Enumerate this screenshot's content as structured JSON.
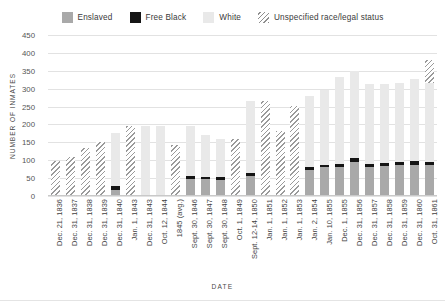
{
  "legend": {
    "items": [
      {
        "label": "Enslaved",
        "swatch": "enslaved-swatch",
        "color": "#a9a9a9"
      },
      {
        "label": "Free Black",
        "swatch": "free-black-swatch",
        "color": "#151515"
      },
      {
        "label": "White",
        "swatch": "white-swatch",
        "color": "#e9e9e9"
      },
      {
        "label": "Unspecified race/legal status",
        "swatch": "unspecified-swatch",
        "color": "#9a9a9a"
      }
    ]
  },
  "chart_data": {
    "type": "bar",
    "title": "",
    "subtitle": "",
    "xlabel": "DATE",
    "ylabel": "NUMBER OF INMATES",
    "ylim": [
      0,
      450
    ],
    "yticks": [
      0,
      50,
      100,
      150,
      200,
      250,
      300,
      350,
      400,
      450
    ],
    "ytick_labels": [
      "0",
      "50",
      "100",
      "150",
      "200",
      "250",
      "300",
      "350",
      "400",
      "450"
    ],
    "grid": true,
    "stacked": true,
    "legend_position": "top-center",
    "categories": [
      "Dec. 21, 1836",
      "Dec. 31, 1837",
      "Dec. 31, 1838",
      "Dec. 31, 1839",
      "Dec. 31, 1840",
      "Jan. 1, 1843",
      "Dec. 31, 1843",
      "Oct. 12, 1844",
      "1845 (avg.)",
      "Sept. 30, 1846",
      "Sept. 30, 1847",
      "Sept. 30, 1848",
      "Oct. 1, 1849",
      "Sept. 12-14, 1850",
      "Jan. 1, 1851",
      "Jan. 1, 1852",
      "Jan. 1, 1853",
      "Jan. 2, 1854",
      "Jan. 10, 1855",
      "Dec. 1, 1855",
      "Dec. 31, 1856",
      "Dec. 31, 1857",
      "Dec. 31, 1858",
      "Dec. 31, 1859",
      "Dec. 31, 1860",
      "Oct. 31, 1861"
    ],
    "series": [
      {
        "name": "Enslaved",
        "color": "#a9a9a9",
        "values": [
          0,
          0,
          0,
          0,
          18,
          0,
          0,
          0,
          0,
          47,
          47,
          45,
          0,
          55,
          0,
          0,
          0,
          72,
          80,
          82,
          96,
          82,
          84,
          86,
          88,
          86
        ]
      },
      {
        "name": "Free Black",
        "color": "#151515",
        "values": [
          0,
          0,
          0,
          0,
          9,
          0,
          0,
          0,
          0,
          8,
          6,
          8,
          0,
          8,
          0,
          0,
          0,
          9,
          8,
          8,
          9,
          8,
          8,
          9,
          9,
          9
        ]
      },
      {
        "name": "White",
        "color": "#e9e9e9",
        "values": [
          0,
          0,
          0,
          0,
          148,
          0,
          197,
          195,
          0,
          140,
          118,
          107,
          0,
          203,
          0,
          0,
          0,
          199,
          207,
          242,
          245,
          222,
          222,
          222,
          229,
          222
        ]
      },
      {
        "name": "Unspecified race/legal status",
        "color": "#9a9a9a",
        "values": [
          98,
          108,
          134,
          152,
          0,
          196,
          0,
          0,
          143,
          0,
          0,
          0,
          158,
          0,
          265,
          182,
          252,
          0,
          0,
          0,
          0,
          0,
          0,
          0,
          0,
          63
        ]
      }
    ],
    "totals": [
      98,
      108,
      134,
      152,
      175,
      196,
      197,
      195,
      143,
      195,
      171,
      160,
      158,
      266,
      265,
      182,
      252,
      280,
      295,
      332,
      350,
      312,
      314,
      317,
      326,
      380
    ]
  }
}
